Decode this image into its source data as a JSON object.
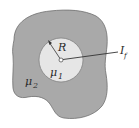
{
  "diagram": {
    "colors": {
      "outer_region": "#a9a9a9",
      "inner_region": "#e6e6e6",
      "stroke": "#555555",
      "background": "#ffffff"
    },
    "labels": {
      "radius": "R",
      "inner_mu": "μ",
      "inner_mu_sub": "1",
      "outer_mu": "μ",
      "outer_mu_sub": "2",
      "current": "I",
      "current_sub": "f"
    }
  }
}
